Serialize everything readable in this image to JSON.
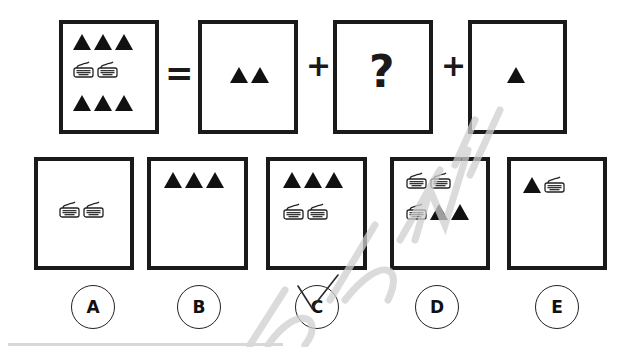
{
  "question": {
    "equation": {
      "whole": {
        "triangles_top": 3,
        "keyboards": 2,
        "triangles_bottom": 3
      },
      "equals_symbol": "=",
      "part1": {
        "triangles": 2
      },
      "plus_symbol_1": "+",
      "unknown": {
        "label": "?"
      },
      "plus_symbol_2": "+",
      "part3": {
        "triangles": 1
      }
    }
  },
  "options": [
    {
      "letter": "A",
      "contents": "2 keyboards",
      "selected": false
    },
    {
      "letter": "B",
      "contents": "3 triangles",
      "selected": false
    },
    {
      "letter": "C",
      "contents": "3 triangles, 2 keyboards",
      "selected": true
    },
    {
      "letter": "D",
      "contents": "3 keyboards, 2 triangles",
      "selected": false
    },
    {
      "letter": "E",
      "contents": "1 triangle, 1 keyboard",
      "selected": false
    }
  ],
  "colors": {
    "ink": "#1a1a1a",
    "watermark": "#c8c8c8",
    "background": "#ffffff"
  }
}
